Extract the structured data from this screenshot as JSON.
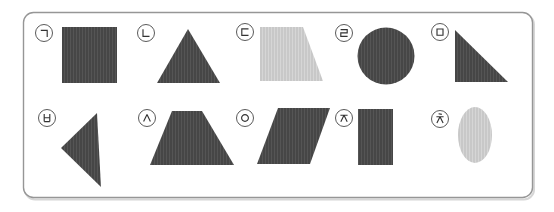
{
  "figure": {
    "canvas": {
      "width": 554,
      "height": 212,
      "background": "#ffffff"
    },
    "panel": {
      "x": 23.5,
      "y": 12.5,
      "width": 509,
      "height": 185,
      "radius": 10,
      "fill": "#ffffff",
      "border_color": "#969696",
      "shadow_color": "#d6d6d6"
    },
    "colors": {
      "dark_shape": "#464646",
      "dark_stripe": "#555555",
      "light_shape": "#c8c8c8",
      "light_stripe": "#d6d6d6",
      "label_ring": "#5a5a5a",
      "label_glyph": "#333333",
      "label_fill": "#ffffff"
    },
    "items": [
      {
        "id": "giyeok",
        "label": "㉠",
        "jamo": "giyeok",
        "label_cx": 44,
        "label_cy": 33,
        "shape": {
          "name": "square",
          "fill": "dark",
          "type": "polygon",
          "points": "62,27 117,27 117,83 62,83"
        }
      },
      {
        "id": "nieun",
        "label": "㉡",
        "jamo": "nieun",
        "label_cx": 146,
        "label_cy": 33,
        "shape": {
          "name": "triangle",
          "fill": "dark",
          "type": "polygon",
          "points": "188,29 157,83 220,83"
        }
      },
      {
        "id": "digeut",
        "label": "㉢",
        "jamo": "digeut",
        "label_cx": 245,
        "label_cy": 32,
        "shape": {
          "name": "right-trapezoid",
          "fill": "light",
          "type": "polygon",
          "points": "260,27 303,27 323,81 260,81"
        }
      },
      {
        "id": "rieul",
        "label": "㉣",
        "jamo": "rieul",
        "label_cx": 344,
        "label_cy": 33,
        "shape": {
          "name": "circle",
          "fill": "dark",
          "type": "circle",
          "cx": 386,
          "cy": 56,
          "r": 28.5
        }
      },
      {
        "id": "mieum",
        "label": "㉤",
        "jamo": "mieum",
        "label_cx": 440,
        "label_cy": 32,
        "shape": {
          "name": "right-triangle",
          "fill": "dark",
          "type": "polygon",
          "points": "455,30 508,82 455,82"
        }
      },
      {
        "id": "bieup",
        "label": "㉥",
        "jamo": "bieup",
        "label_cx": 47,
        "label_cy": 118,
        "shape": {
          "name": "left-triangle",
          "fill": "dark",
          "type": "polygon",
          "points": "97,113 101,187 61,148"
        }
      },
      {
        "id": "siot",
        "label": "㉦",
        "jamo": "siot",
        "label_cx": 147,
        "label_cy": 118,
        "shape": {
          "name": "trapezoid",
          "fill": "dark",
          "type": "polygon",
          "points": "172,111 202,111 234,165 150,165"
        }
      },
      {
        "id": "ieung",
        "label": "㉧",
        "jamo": "ieung",
        "label_cx": 245,
        "label_cy": 118,
        "shape": {
          "name": "parallelogram",
          "fill": "dark",
          "type": "polygon",
          "points": "278,108 330,108 310,164 257,164"
        }
      },
      {
        "id": "jieut",
        "label": "㉨",
        "jamo": "jieut",
        "label_cx": 344,
        "label_cy": 118,
        "shape": {
          "name": "rectangle",
          "fill": "dark",
          "type": "polygon",
          "points": "358,109 393,109 393,165 358,165"
        }
      },
      {
        "id": "chieut",
        "label": "㉩",
        "jamo": "chieut",
        "label_cx": 440,
        "label_cy": 119,
        "shape": {
          "name": "ellipse",
          "fill": "light",
          "type": "ellipse",
          "cx": 475,
          "cy": 135,
          "rx": 17,
          "ry": 28
        }
      }
    ]
  }
}
